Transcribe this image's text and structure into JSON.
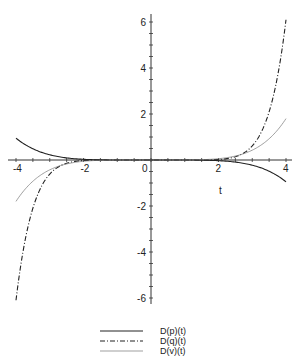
{
  "chart_data": {
    "type": "line",
    "title": "",
    "xlabel": "t",
    "ylabel": "",
    "xlim": [
      -4,
      4
    ],
    "ylim": [
      -6.3,
      6.3
    ],
    "grid": false,
    "legend_position": "bottom",
    "x_ticks": [
      -4,
      -2,
      0,
      2,
      4
    ],
    "y_ticks": [
      -6,
      -4,
      -2,
      2,
      4,
      6
    ],
    "x": [
      -4,
      -3.5,
      -3,
      -2.5,
      -2,
      -1.5,
      -1,
      0,
      1,
      1.5,
      2,
      2.5,
      3,
      3.5,
      4
    ],
    "series": [
      {
        "name": "D(p)(t)",
        "style": "solid",
        "values": [
          0.95,
          0.49,
          0.23,
          0.09,
          0.03,
          0.01,
          0.0,
          0.0,
          0.0,
          -0.01,
          -0.03,
          -0.09,
          -0.23,
          -0.49,
          -0.95
        ]
      },
      {
        "name": "D(q)(t)",
        "style": "dashdot",
        "values": [
          -6.1,
          -2.1,
          -0.61,
          -0.14,
          -0.02,
          0.0,
          0.0,
          0.0,
          0.0,
          0.0,
          0.02,
          0.14,
          0.61,
          2.1,
          6.1
        ]
      },
      {
        "name": "D(v)(t)",
        "style": "dotted",
        "values": [
          -1.8,
          -0.92,
          -0.43,
          -0.17,
          -0.06,
          -0.01,
          0.0,
          0.0,
          0.0,
          0.01,
          0.06,
          0.17,
          0.43,
          0.92,
          1.8
        ]
      }
    ]
  },
  "legend": {
    "items": [
      {
        "label": "D(p)(t)"
      },
      {
        "label": "D(q)(t)"
      },
      {
        "label": "D(v)(t)"
      }
    ]
  },
  "axes": {
    "x_label": "t",
    "x_tick_labels": [
      "-4",
      "-2",
      "0",
      "2",
      "4"
    ],
    "y_tick_labels": [
      "6",
      "4",
      "2",
      "-2",
      "-4",
      "-6"
    ]
  }
}
